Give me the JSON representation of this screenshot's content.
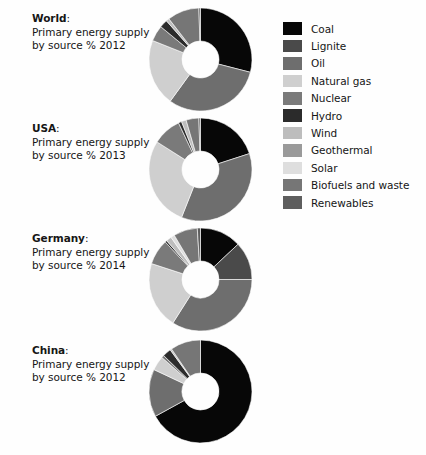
{
  "background_color": "#fefefe",
  "text_color": "#161616",
  "legend": {
    "title": "",
    "items": [
      {
        "label": "Coal",
        "color": "#070707"
      },
      {
        "label": "Lignite",
        "color": "#4a4a4a"
      },
      {
        "label": "Oil",
        "color": "#6e6e6e"
      },
      {
        "label": "Natural gas",
        "color": "#cfcfcf"
      },
      {
        "label": "Nuclear",
        "color": "#7a7a7a"
      },
      {
        "label": "Hydro",
        "color": "#2b2b2b"
      },
      {
        "label": "Wind",
        "color": "#bdbdbd"
      },
      {
        "label": "Geothermal",
        "color": "#9a9a9a"
      },
      {
        "label": "Solar",
        "color": "#dedede"
      },
      {
        "label": "Biofuels and waste",
        "color": "#767676"
      },
      {
        "label": "Renewables",
        "color": "#5e5e5e"
      }
    ]
  },
  "chart_data": {
    "type": "pie",
    "title": "Primary energy supply by source %",
    "variant": "donut",
    "legend_position": "right",
    "categories": [
      "Coal",
      "Lignite",
      "Oil",
      "Natural gas",
      "Nuclear",
      "Hydro",
      "Wind",
      "Geothermal",
      "Solar",
      "Biofuels and waste",
      "Renewables"
    ],
    "colors": [
      "#070707",
      "#4a4a4a",
      "#6e6e6e",
      "#cfcfcf",
      "#7a7a7a",
      "#2b2b2b",
      "#bdbdbd",
      "#9a9a9a",
      "#dedede",
      "#767676",
      "#5e5e5e"
    ],
    "charts": [
      {
        "region": "World",
        "region_suffix": ":",
        "description": "Primary energy supply\nby source % 2012",
        "year": "2012",
        "values": [
          29,
          0,
          31,
          21,
          5,
          2.5,
          1,
          0,
          0,
          10,
          0.5
        ]
      },
      {
        "region": "USA",
        "region_suffix": ":",
        "description": "Primary energy supply\nby source % 2013",
        "year": "2013",
        "values": [
          20,
          0,
          36,
          28,
          9,
          1,
          1.5,
          0,
          0,
          4,
          0.5
        ]
      },
      {
        "region": "Germany",
        "region_suffix": ":",
        "description": "Primary energy supply\nby source % 2014",
        "year": "2014",
        "values": [
          13,
          12,
          34,
          21,
          8,
          0.6,
          1.7,
          0,
          1.2,
          7.5,
          1
        ]
      },
      {
        "region": "China",
        "region_suffix": ":",
        "description": "Primary energy supply\nby source % 2012",
        "year": "2012",
        "values": [
          67,
          0,
          15,
          4.5,
          0.8,
          2.7,
          0.5,
          0,
          0,
          9.5,
          0
        ]
      }
    ]
  }
}
